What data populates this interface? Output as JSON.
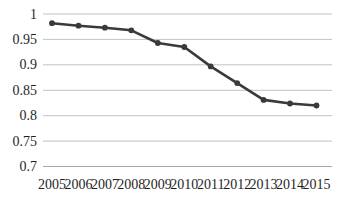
{
  "chart_data": {
    "type": "line",
    "title": "",
    "xlabel": "",
    "ylabel": "",
    "categories": [
      "2005",
      "2006",
      "2007",
      "2008",
      "2009",
      "2010",
      "2011",
      "2012",
      "2013",
      "2014",
      "2015"
    ],
    "series": [
      {
        "name": "value",
        "values": [
          0.982,
          0.977,
          0.973,
          0.968,
          0.943,
          0.935,
          0.897,
          0.864,
          0.831,
          0.824,
          0.82
        ]
      }
    ],
    "ylim": [
      0.7,
      1.0
    ],
    "yticks": [
      {
        "value": 1.0,
        "label": "1"
      },
      {
        "value": 0.95,
        "label": "0.95"
      },
      {
        "value": 0.9,
        "label": "0.9"
      },
      {
        "value": 0.85,
        "label": "0.85"
      },
      {
        "value": 0.8,
        "label": "0.8"
      },
      {
        "value": 0.75,
        "label": "0.75"
      },
      {
        "value": 0.7,
        "label": "0.7"
      }
    ],
    "grid": true,
    "legend": "none",
    "marker": "circle",
    "colors": {
      "line": "#3a3a3a",
      "marker": "#3a3a3a",
      "gridline": "#c2c2c2",
      "axis_line": "#a8a8a8",
      "text": "#1f1f1f",
      "background": "#ffffff"
    }
  }
}
